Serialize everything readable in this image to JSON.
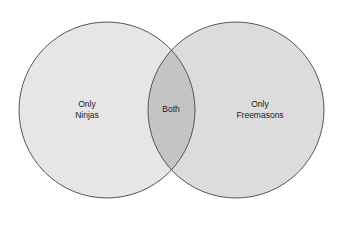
{
  "diagram": {
    "type": "venn",
    "sets": [
      {
        "id": "ninjas",
        "label_line1": "Only",
        "label_line2": "Ninjas",
        "cx": 107,
        "cy": 110,
        "r": 88
      },
      {
        "id": "freemasons",
        "label_line1": "Only",
        "label_line2": "Freemasons",
        "cx": 236,
        "cy": 110,
        "r": 88
      }
    ],
    "intersection": {
      "label": "Both"
    },
    "colors": {
      "left_fill": "#e6e6e6",
      "right_fill": "#dcdcdc",
      "intersection_fill": "#c4c4c4",
      "stroke": "#555555"
    }
  }
}
